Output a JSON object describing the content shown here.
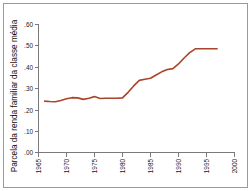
{
  "figure": {
    "background_color": "#ffffff",
    "border_color": "#9a9a9a",
    "axis_color": "#7a7a7a"
  },
  "chart_data": {
    "type": "line",
    "title": "",
    "subtitle": "",
    "xlabel": "",
    "ylabel": "Parcela da renda familiar da classe média",
    "xlim": [
      1965,
      2000
    ],
    "ylim": [
      0.0,
      0.6
    ],
    "grid": false,
    "legend": false,
    "legend_position": "none",
    "line_color": "#a8442a",
    "x_tick_labels": [
      "1965",
      "1970",
      "1975",
      "1980",
      "1985",
      "1990",
      "1995",
      "2000"
    ],
    "x_ticks": [
      1965,
      1970,
      1975,
      1980,
      1985,
      1990,
      1995,
      2000
    ],
    "y_tick_labels": [
      ".00",
      ".10",
      ".20",
      ".30",
      ".40",
      ".50",
      ".60"
    ],
    "y_ticks": [
      0.0,
      0.1,
      0.2,
      0.3,
      0.4,
      0.5,
      0.6
    ],
    "series": [
      {
        "name": "Parcela da renda familiar da classe média",
        "x": [
          1966,
          1967,
          1968,
          1969,
          1970,
          1971,
          1972,
          1973,
          1974,
          1975,
          1976,
          1977,
          1978,
          1979,
          1980,
          1981,
          1982,
          1983,
          1984,
          1985,
          1986,
          1987,
          1988,
          1989,
          1990,
          1991,
          1992,
          1993,
          1994,
          1995,
          1996,
          1997
        ],
        "values": [
          0.241,
          0.239,
          0.238,
          0.244,
          0.252,
          0.257,
          0.256,
          0.249,
          0.254,
          0.262,
          0.253,
          0.254,
          0.254,
          0.254,
          0.256,
          0.282,
          0.312,
          0.338,
          0.343,
          0.348,
          0.363,
          0.378,
          0.389,
          0.393,
          0.415,
          0.443,
          0.468,
          0.486,
          0.486,
          0.486,
          0.486,
          0.486
        ]
      }
    ]
  }
}
